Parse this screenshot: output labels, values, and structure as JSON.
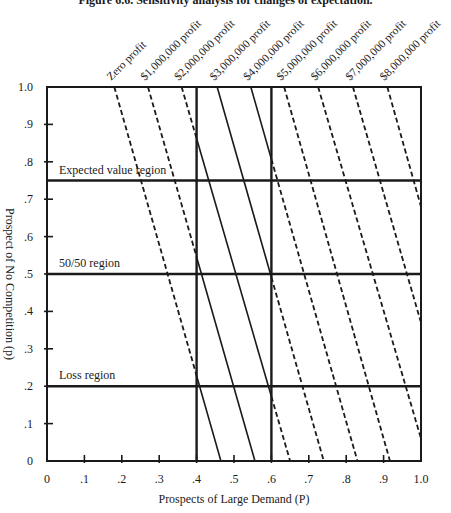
{
  "chart_data": {
    "type": "line",
    "title": "Figure 6.6. Sensitivity analysis for changes of expectation.",
    "xlabel": "Prospects of Large Demand (P)",
    "ylabel": "Prospect of No Competition (p)",
    "xlim": [
      0,
      1.0
    ],
    "ylim": [
      0,
      1.0
    ],
    "x_ticks": [
      0,
      0.1,
      0.2,
      0.3,
      0.4,
      0.5,
      0.6,
      0.7,
      0.8,
      0.9,
      1.0
    ],
    "x_tick_labels": [
      "0",
      ".1",
      ".2",
      ".3",
      ".4",
      ".5",
      ".6",
      ".7",
      ".8",
      ".9",
      "1.0"
    ],
    "y_ticks": [
      0,
      0.1,
      0.2,
      0.3,
      0.4,
      0.5,
      0.6,
      0.7,
      0.8,
      0.9,
      1.0
    ],
    "y_tick_labels": [
      "0",
      ".1",
      ".2",
      ".3",
      ".4",
      ".5",
      ".6",
      ".7",
      ".8",
      ".9",
      "1.0"
    ],
    "grid": false,
    "note": "Iso-profit lines are solid between P=0.4 and P=0.6, dashed elsewhere",
    "solid_band": [
      0.4,
      0.6
    ],
    "series": [
      {
        "name": "Zero profit",
        "points": [
          [
            0.18,
            1.0
          ],
          [
            0.465,
            0.0
          ]
        ]
      },
      {
        "name": "$1,000,000 profit",
        "points": [
          [
            0.27,
            1.0
          ],
          [
            0.556,
            0.0
          ]
        ]
      },
      {
        "name": "$2,000,000 profit",
        "points": [
          [
            0.36,
            1.0
          ],
          [
            0.65,
            0.0
          ]
        ]
      },
      {
        "name": "$3,000,000 profit",
        "points": [
          [
            0.455,
            1.0
          ],
          [
            0.74,
            0.0
          ]
        ]
      },
      {
        "name": "$4,000,000 profit",
        "points": [
          [
            0.545,
            1.0
          ],
          [
            0.83,
            0.0
          ]
        ]
      },
      {
        "name": "$5,000,000 profit",
        "points": [
          [
            0.634,
            1.0
          ],
          [
            0.917,
            0.0
          ]
        ]
      },
      {
        "name": "$6,000,000 profit",
        "points": [
          [
            0.725,
            1.0
          ],
          [
            1.0,
            0.06
          ]
        ]
      },
      {
        "name": "$7,000,000 profit",
        "points": [
          [
            0.818,
            1.0
          ],
          [
            1.0,
            0.37
          ]
        ]
      },
      {
        "name": "$8,000,000 profit",
        "points": [
          [
            0.91,
            1.0
          ],
          [
            1.0,
            0.68
          ]
        ]
      }
    ],
    "vertical_lines": [
      0.4,
      0.6
    ],
    "horizontal_regions": [
      {
        "label": "Expected value region",
        "y": 0.75
      },
      {
        "label": "50/50 region",
        "y": 0.5
      },
      {
        "label": "Loss region",
        "y": 0.2
      }
    ]
  }
}
